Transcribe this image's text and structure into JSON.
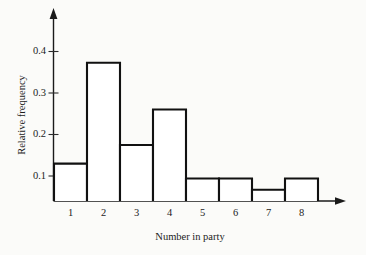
{
  "chart_data": {
    "type": "bar",
    "title": "",
    "subtitle": "",
    "xlabel": "Number in party",
    "ylabel": "Relative frequency",
    "categories": [
      "1",
      "2",
      "3",
      "4",
      "5",
      "6",
      "7",
      "8"
    ],
    "values": [
      0.1,
      0.37,
      0.15,
      0.245,
      0.06,
      0.06,
      0.03,
      0.06
    ],
    "series": [
      {
        "name": "Relative frequency",
        "values": [
          0.1,
          0.37,
          0.15,
          0.245,
          0.06,
          0.06,
          0.03,
          0.06
        ]
      }
    ],
    "ylim": [
      0,
      0.45
    ],
    "xlim": [
      0.5,
      8.5
    ],
    "yticks": [
      0.1,
      0.2,
      0.3,
      0.4
    ],
    "ytick_labels": [
      "0.1",
      "0.2",
      "0.3",
      "0.4"
    ],
    "xtick_labels": [
      "1",
      "2",
      "3",
      "4",
      "5",
      "6",
      "7",
      "8"
    ],
    "grid": false,
    "legend": false,
    "legend_position": "none",
    "bar_style": "histogram-outline",
    "colors": {
      "bar_fill": "#ffffff",
      "bar_stroke": "#111111",
      "axis": "#1a1a1a",
      "text": "#1c1c1c",
      "background": "#fbfbf9"
    },
    "annotations": []
  },
  "axes": {
    "y_axis_name": "Relative frequency",
    "x_axis_name": "Number in party",
    "y_arrow": "up-arrow",
    "x_arrow": "right-arrow"
  }
}
